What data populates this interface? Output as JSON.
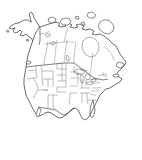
{
  "figure": {
    "title": "",
    "caption": "",
    "kind": "range-map",
    "region": "North America",
    "background_color": "#ffffff",
    "width_px": 142,
    "height_px": 160
  },
  "style": {
    "coast_stroke": "#2b2b2b",
    "country_border_stroke": "#3a3a3a",
    "state_border_stroke": "#585858",
    "subdivision_border_stroke": "#6b6b6b",
    "land_fill": "#ffffff",
    "lake_fill": "#ffffff"
  },
  "density_scale": {
    "label": "",
    "classes": [
      {
        "name": "none",
        "color": "#ffffff",
        "opacity": 0
      },
      {
        "name": "very-low",
        "color": "#d8d8d8",
        "opacity": 0.45
      },
      {
        "name": "low",
        "color": "#c4c4c4",
        "opacity": 0.55
      },
      {
        "name": "moderate",
        "color": "#ababab",
        "opacity": 0.6
      },
      {
        "name": "high",
        "color": "#8f8f8f",
        "opacity": 0.7
      },
      {
        "name": "very-high",
        "color": "#6a6a6a",
        "opacity": 0.85
      }
    ]
  },
  "shaded_regions": [
    {
      "name": "western-canada-prairies",
      "class": "very-low"
    },
    {
      "name": "pacific-northwest",
      "class": "low"
    },
    {
      "name": "great-basin",
      "class": "moderate"
    },
    {
      "name": "california-nevada",
      "class": "low"
    },
    {
      "name": "northern-great-plains",
      "class": "very-low"
    },
    {
      "name": "central-great-plains",
      "class": "low"
    },
    {
      "name": "southern-rockies",
      "class": "high"
    },
    {
      "name": "arizona-new-mexico-core",
      "class": "very-high"
    },
    {
      "name": "midwest-fringe",
      "class": "very-low"
    }
  ],
  "map_labels": {
    "countries": [],
    "states": [],
    "cities": []
  },
  "legend": {
    "visible": false,
    "entries": []
  },
  "axes": {
    "visible": false,
    "graticule": false
  },
  "annotations": []
}
